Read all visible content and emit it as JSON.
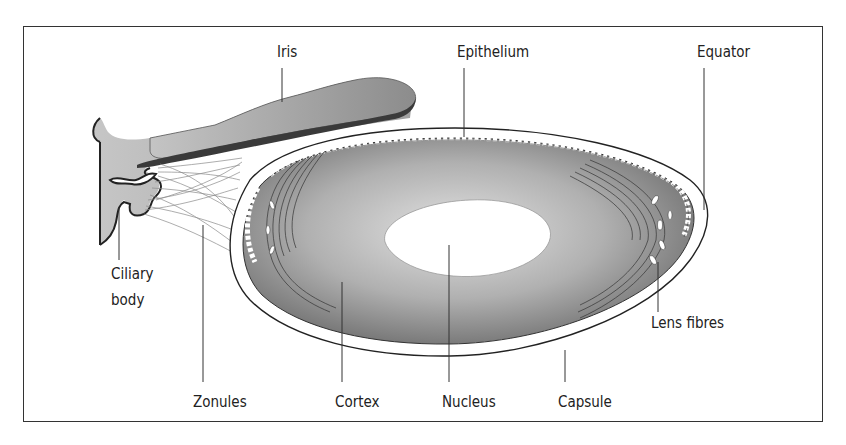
{
  "figure": {
    "labels": {
      "iris": "Iris",
      "epithelium": "Epithelium",
      "equator": "Equator",
      "ciliary_body_line1": "Ciliary",
      "ciliary_body_line2": "body",
      "lens_fibres": "Lens fibres",
      "zonules": "Zonules",
      "cortex": "Cortex",
      "nucleus": "Nucleus",
      "capsule": "Capsule"
    },
    "colors": {
      "frame": "#333333",
      "iris_fill": "#9a9a9a",
      "iris_pigment": "#3a3a3a",
      "ciliary_fill": "#a8a8a8",
      "cortex_outer": "#7a7a7a",
      "cortex_inner": "#d8d8d8",
      "nucleus": "#ffffff",
      "leader_line": "#333333"
    }
  }
}
